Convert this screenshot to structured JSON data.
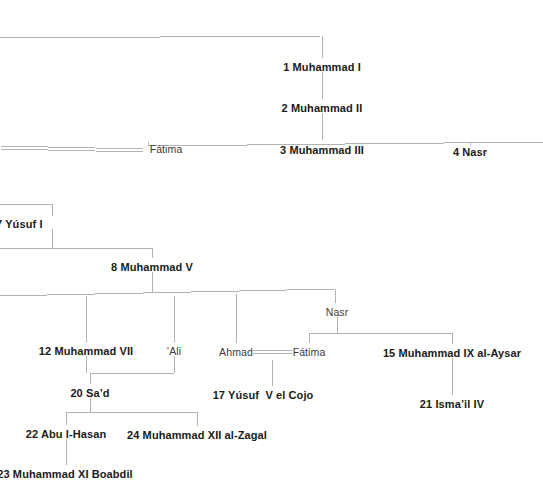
{
  "diagram": {
    "type": "family-tree",
    "background_color": "#ffffff",
    "line_color": "#b3b3b3",
    "text_color": "#231f20"
  },
  "nodes": [
    {
      "id": "muhammad-i",
      "label": "1 Muhammad I",
      "x": 322,
      "y": 68,
      "style": "bold",
      "anchor": "center"
    },
    {
      "id": "muhammad-ii",
      "label": "2 Muhammad II",
      "x": 322,
      "y": 109,
      "style": "bold",
      "anchor": "center"
    },
    {
      "id": "fatima-upper",
      "label": "Fátima",
      "x": 166,
      "y": 150,
      "style": "plain",
      "anchor": "center"
    },
    {
      "id": "muhammad-iii",
      "label": "3 Muhammad III",
      "x": 322,
      "y": 151,
      "style": "bold",
      "anchor": "center"
    },
    {
      "id": "nasr-4",
      "label": "4 Nasr",
      "x": 470,
      "y": 153,
      "style": "bold",
      "anchor": "center"
    },
    {
      "id": "yusuf-i",
      "label": "7 Yúsuf I",
      "x": -4,
      "y": 225,
      "style": "bold",
      "anchor": "left"
    },
    {
      "id": "muhammad-v",
      "label": "8 Muhammad V",
      "x": 152,
      "y": 268,
      "style": "bold",
      "anchor": "center"
    },
    {
      "id": "nasr-son",
      "label": "Nasr",
      "x": 337,
      "y": 313,
      "style": "plain",
      "anchor": "center"
    },
    {
      "id": "muhammad-vii",
      "label": "12 Muhammad VII",
      "x": 86,
      "y": 352,
      "style": "bold",
      "anchor": "center"
    },
    {
      "id": "ali",
      "label": "‘Ali",
      "x": 174,
      "y": 352,
      "style": "plain",
      "anchor": "center"
    },
    {
      "id": "ahmad",
      "label": "Ahmad",
      "x": 236,
      "y": 353,
      "style": "plain",
      "anchor": "center"
    },
    {
      "id": "fatima-lower",
      "label": "Fátima",
      "x": 309,
      "y": 353,
      "style": "plain",
      "anchor": "center"
    },
    {
      "id": "muhammad-ix",
      "label": "15 Muhammad IX al-Aysar",
      "x": 452,
      "y": 354,
      "style": "bold",
      "anchor": "center"
    },
    {
      "id": "sad",
      "label": "20 Sa’d",
      "x": 90,
      "y": 394,
      "style": "bold",
      "anchor": "center"
    },
    {
      "id": "yusuf-v",
      "label": "17 Yúsuf  V el Cojo",
      "x": 263,
      "y": 396,
      "style": "bold",
      "anchor": "center"
    },
    {
      "id": "ismail-iv",
      "label": "21 Isma’il IV",
      "x": 452,
      "y": 405,
      "style": "bold",
      "anchor": "center"
    },
    {
      "id": "abu-l-hasan",
      "label": "22 Abu l-Hasan",
      "x": 66,
      "y": 435,
      "style": "bold",
      "anchor": "center"
    },
    {
      "id": "muhammad-xii",
      "label": "24 Muhammad XII al-Zagal",
      "x": 197,
      "y": 436,
      "style": "bold",
      "anchor": "center"
    },
    {
      "id": "muhammad-xi-boabdil",
      "label": "23 Muhammad XI Boabdil",
      "x": 65,
      "y": 475,
      "style": "bold",
      "anchor": "center"
    }
  ],
  "connectors": {
    "single_lines": [
      {
        "id": "top-sibling-bar",
        "points": "0,38 322,36"
      },
      {
        "id": "muhammad-i-drop",
        "points": "322,36 322,58"
      },
      {
        "id": "muhammad-i-to-ii",
        "points": "322,72 322,99"
      },
      {
        "id": "muhammad-ii-drop",
        "points": "322,113 322,140"
      },
      {
        "id": "gen3-sibling-bar",
        "points": "148,146 543,142"
      },
      {
        "id": "fatima-upper-drop",
        "points": "148,146 148,142"
      },
      {
        "id": "nasr4-drop",
        "points": "470,143 470,145"
      },
      {
        "id": "yusuf-i-parent-drop",
        "points": "52,204 52,216"
      },
      {
        "id": "yusuf-i-parent-bar",
        "points": "0,204 52,204"
      },
      {
        "id": "yusuf-i-drop",
        "points": "52,229 52,248"
      },
      {
        "id": "gen-v-bar",
        "points": "0,248 152,248"
      },
      {
        "id": "muhammad-v-drop",
        "points": "152,248 152,258"
      },
      {
        "id": "muhammad-v-child-drop",
        "points": "152,272 152,292"
      },
      {
        "id": "gen-vi-bar",
        "points": "0,296 335,289"
      },
      {
        "id": "nasr-son-drop",
        "points": "335,289 335,303"
      },
      {
        "id": "mvii-drop",
        "points": "86,296 86,342"
      },
      {
        "id": "ali-drop",
        "points": "174,296 174,342"
      },
      {
        "id": "ahmad-drop",
        "points": "236,294 236,343"
      },
      {
        "id": "nasr-children-drop",
        "points": "337,317 337,333"
      },
      {
        "id": "nasr-children-bar",
        "points": "309,333 452,333"
      },
      {
        "id": "fatima-lower-drop",
        "points": "309,333 309,343"
      },
      {
        "id": "muhammad-ix-drop",
        "points": "452,333 452,344"
      },
      {
        "id": "mix-to-ismail",
        "points": "452,358 452,395"
      },
      {
        "id": "mvii-ali-bar",
        "points": "90,373 174,373"
      },
      {
        "id": "mvii-to-bar",
        "points": "86,356 86,373"
      },
      {
        "id": "ali-to-bar",
        "points": "174,356 174,373"
      },
      {
        "id": "sad-drop",
        "points": "90,373 90,384"
      },
      {
        "id": "sad-children-drop",
        "points": "90,398 90,412"
      },
      {
        "id": "sad-children-bar",
        "points": "66,412 197,412"
      },
      {
        "id": "abu-l-hasan-drop",
        "points": "66,412 66,425"
      },
      {
        "id": "muhammad-xii-drop",
        "points": "197,412 197,426"
      },
      {
        "id": "abu-to-boabdil",
        "points": "66,439 66,465"
      },
      {
        "id": "yusuf-v-drop",
        "points": "272,360 272,386"
      }
    ],
    "marriage_lines": [
      {
        "id": "marriage-fatima-upper",
        "x1": 0,
        "x2": 143,
        "y": 146,
        "y2": 149
      },
      {
        "id": "marriage-ahmad-fatima",
        "x1": 253,
        "x2": 292,
        "y": 350,
        "y2": 350
      }
    ]
  }
}
